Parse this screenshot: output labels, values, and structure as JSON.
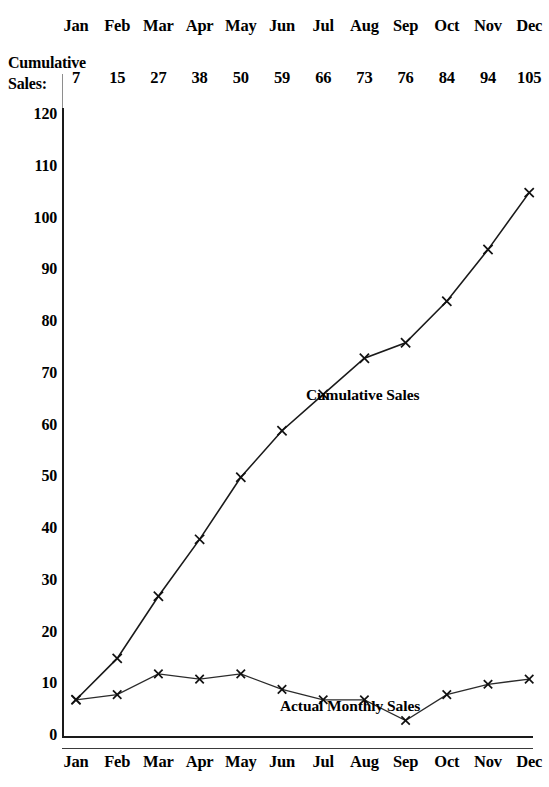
{
  "table": {
    "row_label_line1": "Cumulative",
    "row_label_line2": "Sales:",
    "months": [
      "Jan",
      "Feb",
      "Mar",
      "Apr",
      "May",
      "Jun",
      "Jul",
      "Aug",
      "Sep",
      "Oct",
      "Nov",
      "Dec"
    ],
    "cumulative_values": [
      "7",
      "15",
      "27",
      "38",
      "50",
      "59",
      "66",
      "73",
      "76",
      "84",
      "94",
      "105"
    ]
  },
  "axis": {
    "y_ticks": [
      "120",
      "110",
      "100",
      "90",
      "80",
      "70",
      "60",
      "50",
      "40",
      "30",
      "20",
      "10",
      "0"
    ],
    "x_labels": [
      "Jan",
      "Feb",
      "Mar",
      "Apr",
      "May",
      "Jun",
      "Jul",
      "Aug",
      "Sep",
      "Oct",
      "Nov",
      "Dec"
    ]
  },
  "annotations": {
    "cumulative_label": "Cumulative Sales",
    "monthly_label": "Actual Monthly Sales"
  },
  "colors": {
    "ink": "#1a1a1a",
    "line": "#1a1a1a",
    "background": "#ffffff"
  },
  "chart_data": {
    "type": "line",
    "title": "",
    "xlabel": "",
    "ylabel": "",
    "ylim": [
      0,
      120
    ],
    "ytick_step": 10,
    "grid": false,
    "legend": "inline-annotations",
    "categories": [
      "Jan",
      "Feb",
      "Mar",
      "Apr",
      "May",
      "Jun",
      "Jul",
      "Aug",
      "Sep",
      "Oct",
      "Nov",
      "Dec"
    ],
    "series": [
      {
        "name": "Cumulative Sales",
        "marker": "x",
        "values": [
          7,
          15,
          27,
          38,
          50,
          59,
          66,
          73,
          76,
          84,
          94,
          105
        ]
      },
      {
        "name": "Actual Monthly Sales",
        "marker": "x",
        "values": [
          7,
          8,
          12,
          11,
          12,
          9,
          7,
          7,
          3,
          8,
          10,
          11
        ]
      }
    ]
  }
}
